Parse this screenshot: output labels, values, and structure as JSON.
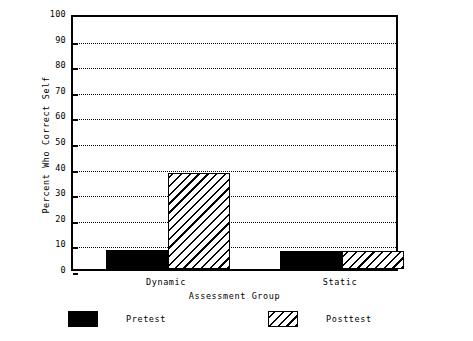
{
  "chart_data": {
    "type": "bar",
    "title": "",
    "xlabel": "Assessment Group",
    "ylabel": "Percent Who Correct Self",
    "categories": [
      "Dynamic",
      "Static"
    ],
    "series": [
      {
        "name": "Pretest",
        "values": [
          7.5,
          7.0
        ],
        "fill": "solid",
        "color": "#000000"
      },
      {
        "name": "Posttest",
        "values": [
          37.5,
          7.0
        ],
        "fill": "hatch",
        "color": "#000000"
      }
    ],
    "ylim": [
      0,
      100
    ],
    "yticks": [
      0,
      10,
      20,
      30,
      40,
      50,
      60,
      70,
      80,
      90,
      100
    ],
    "ytick_labels": [
      "0",
      "10",
      "20",
      "30",
      "40",
      "50",
      "60",
      "70",
      "80",
      "90",
      "100"
    ],
    "grid": true,
    "grid_style": "dotted",
    "grid_axis": "y",
    "legend_position": "bottom",
    "legend_entries": [
      "Pretest",
      "Posttest"
    ],
    "background_color": "#ffffff",
    "foreground_color": "#000000"
  }
}
